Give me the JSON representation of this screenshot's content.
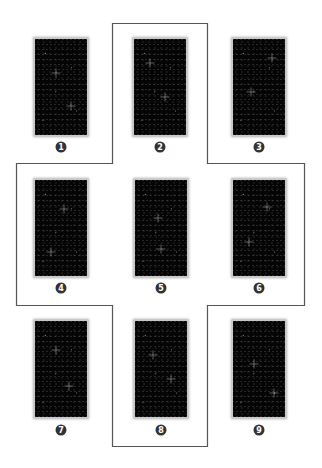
{
  "diagram": {
    "type": "tarot-card-spread",
    "layout": "3x3 grid with cross-shaped outline",
    "colors": {
      "background": "#ffffff",
      "card_face": "#050505",
      "card_border": "#c9c9c9",
      "badge_fill": "#333333",
      "badge_text": "#ffffff",
      "outline": "#555555"
    },
    "cards": [
      {
        "position": "1",
        "x": 33,
        "y": 37,
        "badge_x": 61,
        "badge_y": 147
      },
      {
        "position": "2",
        "x": 132,
        "y": 37,
        "badge_x": 160,
        "badge_y": 147
      },
      {
        "position": "3",
        "x": 231,
        "y": 37,
        "badge_x": 259,
        "badge_y": 147
      },
      {
        "position": "4",
        "x": 33,
        "y": 178,
        "badge_x": 61,
        "badge_y": 288
      },
      {
        "position": "5",
        "x": 133,
        "y": 178,
        "badge_x": 161,
        "badge_y": 288
      },
      {
        "position": "6",
        "x": 231,
        "y": 178,
        "badge_x": 259,
        "badge_y": 288
      },
      {
        "position": "7",
        "x": 33,
        "y": 319,
        "badge_x": 61,
        "badge_y": 430
      },
      {
        "position": "8",
        "x": 133,
        "y": 319,
        "badge_x": 161,
        "badge_y": 430
      },
      {
        "position": "9",
        "x": 231,
        "y": 319,
        "badge_x": 259,
        "badge_y": 430
      }
    ],
    "outline_path": "M112.5 23.5 H207.5 V163.5 H304.5 V305.5 H207.5 V446.5 H112.5 V305.5 H16.5 V163.5 H112.5 Z",
    "highlighted_positions": [
      "2",
      "4",
      "5",
      "6",
      "8"
    ]
  }
}
